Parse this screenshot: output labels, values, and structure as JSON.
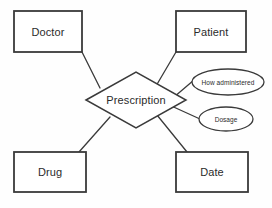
{
  "diagram": {
    "kind": "entity-relationship-diagram",
    "background_color": "#fefefe",
    "stroke_color": "#3a3a3a",
    "text_color": "#2b2b2b",
    "canvas": {
      "width": 272,
      "height": 208
    },
    "entities": [
      {
        "id": "doctor",
        "label": "Doctor",
        "shape": "rectangle",
        "x": 14,
        "y": 11,
        "width": 68,
        "height": 41
      },
      {
        "id": "patient",
        "label": "Patient",
        "shape": "rectangle",
        "x": 176,
        "y": 11,
        "width": 70,
        "height": 41
      },
      {
        "id": "drug",
        "label": "Drug",
        "shape": "rectangle",
        "x": 14,
        "y": 152,
        "width": 72,
        "height": 40
      },
      {
        "id": "date",
        "label": "Date",
        "shape": "rectangle",
        "x": 176,
        "y": 152,
        "width": 72,
        "height": 40
      }
    ],
    "relationships": [
      {
        "id": "prescription",
        "label": "Prescription",
        "shape": "diamond",
        "center_x": 136,
        "center_y": 100,
        "half_width": 50,
        "half_height": 28
      }
    ],
    "attributes": [
      {
        "id": "how-administered",
        "label": "How administered",
        "shape": "ellipse",
        "center_x": 228,
        "center_y": 82,
        "radius_x": 36,
        "radius_y": 13
      },
      {
        "id": "dosage",
        "label": "Dosage",
        "shape": "ellipse",
        "center_x": 226,
        "center_y": 119,
        "radius_x": 27,
        "radius_y": 12
      }
    ],
    "connectors": [
      {
        "id": "doctor-prescription",
        "from": "doctor",
        "to": "prescription",
        "x1": 82,
        "y1": 52,
        "x2": 100,
        "y2": 88
      },
      {
        "id": "patient-prescription",
        "from": "patient",
        "to": "prescription",
        "x1": 176,
        "y1": 52,
        "x2": 156,
        "y2": 86
      },
      {
        "id": "drug-prescription",
        "from": "drug",
        "to": "prescription",
        "x1": 79,
        "y1": 152,
        "x2": 110,
        "y2": 117
      },
      {
        "id": "date-prescription",
        "from": "date",
        "to": "prescription",
        "x1": 187,
        "y1": 152,
        "x2": 157,
        "y2": 115
      },
      {
        "id": "prescription-how-administered",
        "from": "prescription",
        "to": "how-administered",
        "x1": 167,
        "y1": 103,
        "x2": 194,
        "y2": 80
      },
      {
        "id": "prescription-dosage",
        "from": "prescription",
        "to": "dosage",
        "x1": 167,
        "y1": 104,
        "x2": 200,
        "y2": 119
      }
    ]
  }
}
